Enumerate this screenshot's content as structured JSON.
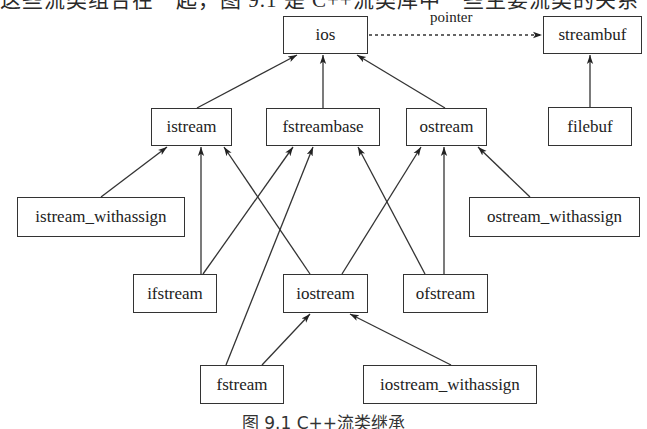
{
  "header_fragment": "这些流类组合在一起，图 9.1 是 C++流类库中一些主要流类的关系",
  "caption": "图 9.1   C++流类继承",
  "colors": {
    "line": "#333333",
    "text": "#222222",
    "background": "#ffffff"
  },
  "nodes": [
    {
      "id": "ios",
      "label": "ios",
      "x": 283,
      "y": 16,
      "w": 85,
      "h": 38
    },
    {
      "id": "streambuf",
      "label": "streambuf",
      "x": 543,
      "y": 16,
      "w": 99,
      "h": 38
    },
    {
      "id": "istream",
      "label": "istream",
      "x": 151,
      "y": 108,
      "w": 81,
      "h": 38
    },
    {
      "id": "fstreambase",
      "label": "fstreambase",
      "x": 266,
      "y": 108,
      "w": 114,
      "h": 38
    },
    {
      "id": "ostream",
      "label": "ostream",
      "x": 406,
      "y": 108,
      "w": 81,
      "h": 38
    },
    {
      "id": "filebuf",
      "label": "filebuf",
      "x": 548,
      "y": 107,
      "w": 84,
      "h": 39
    },
    {
      "id": "istream_withassign",
      "label": "istream_withassign",
      "x": 17,
      "y": 197,
      "w": 168,
      "h": 40
    },
    {
      "id": "ostream_withassign",
      "label": "ostream_withassign",
      "x": 469,
      "y": 197,
      "w": 171,
      "h": 40
    },
    {
      "id": "ifstream",
      "label": "ifstream",
      "x": 133,
      "y": 274,
      "w": 84,
      "h": 39
    },
    {
      "id": "iostream",
      "label": "iostream",
      "x": 283,
      "y": 274,
      "w": 85,
      "h": 39
    },
    {
      "id": "ofstream",
      "label": "ofstream",
      "x": 403,
      "y": 274,
      "w": 85,
      "h": 39
    },
    {
      "id": "fstream",
      "label": "fstream",
      "x": 200,
      "y": 365,
      "w": 84,
      "h": 39
    },
    {
      "id": "iostream_withassign",
      "label": "iostream_withassign",
      "x": 363,
      "y": 365,
      "w": 174,
      "h": 39
    }
  ],
  "edges": [
    {
      "from": "istream",
      "to": "ios",
      "x1": 197,
      "y1": 108,
      "x2": 297,
      "y2": 55,
      "style": "solid"
    },
    {
      "from": "fstreambase",
      "to": "ios",
      "x1": 323,
      "y1": 108,
      "x2": 323,
      "y2": 55,
      "style": "solid"
    },
    {
      "from": "ostream",
      "to": "ios",
      "x1": 445,
      "y1": 108,
      "x2": 357,
      "y2": 55,
      "style": "solid"
    },
    {
      "from": "filebuf",
      "to": "streambuf",
      "x1": 590,
      "y1": 107,
      "x2": 590,
      "y2": 55,
      "style": "solid"
    },
    {
      "from": "ios",
      "to": "streambuf",
      "x1": 369,
      "y1": 35,
      "x2": 542,
      "y2": 35,
      "style": "dashed",
      "label": "pointer"
    },
    {
      "from": "istream_withassign",
      "to": "istream",
      "x1": 101,
      "y1": 197,
      "x2": 167,
      "y2": 147,
      "style": "solid"
    },
    {
      "from": "ifstream",
      "to": "istream",
      "x1": 201,
      "y1": 274,
      "x2": 201,
      "y2": 147,
      "style": "solid"
    },
    {
      "from": "iostream",
      "to": "istream",
      "x1": 310,
      "y1": 274,
      "x2": 224,
      "y2": 147,
      "style": "solid"
    },
    {
      "from": "ifstream",
      "to": "fstreambase",
      "x1": 203,
      "y1": 274,
      "x2": 293,
      "y2": 147,
      "style": "solid"
    },
    {
      "from": "fstream",
      "to": "fstreambase",
      "x1": 226,
      "y1": 365,
      "x2": 313,
      "y2": 147,
      "style": "solid"
    },
    {
      "from": "ofstream",
      "to": "fstreambase",
      "x1": 425,
      "y1": 274,
      "x2": 358,
      "y2": 147,
      "style": "solid"
    },
    {
      "from": "iostream",
      "to": "ostream",
      "x1": 342,
      "y1": 274,
      "x2": 421,
      "y2": 147,
      "style": "solid"
    },
    {
      "from": "ofstream",
      "to": "ostream",
      "x1": 444,
      "y1": 274,
      "x2": 444,
      "y2": 147,
      "style": "solid"
    },
    {
      "from": "ostream_withassign",
      "to": "ostream",
      "x1": 530,
      "y1": 197,
      "x2": 478,
      "y2": 147,
      "style": "solid"
    },
    {
      "from": "fstream",
      "to": "iostream",
      "x1": 262,
      "y1": 365,
      "x2": 310,
      "y2": 314,
      "style": "solid"
    },
    {
      "from": "iostream_withassign",
      "to": "iostream",
      "x1": 451,
      "y1": 365,
      "x2": 350,
      "y2": 314,
      "style": "solid"
    }
  ]
}
